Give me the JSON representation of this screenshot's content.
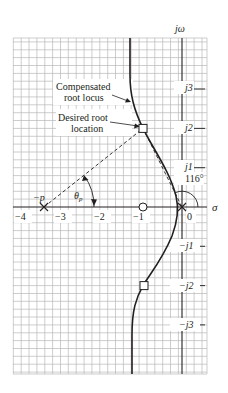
{
  "figure": {
    "type": "root_locus",
    "axes": {
      "imag_label": "jω",
      "real_label": "σ",
      "x_ticks": [
        {
          "value": -4,
          "label": "−4"
        },
        {
          "value": -3,
          "label": "−3"
        },
        {
          "value": -2,
          "label": "−2"
        },
        {
          "value": -1,
          "label": "−1"
        },
        {
          "value": 0,
          "label": "0"
        }
      ],
      "y_ticks": [
        {
          "value": 3,
          "label": "j3"
        },
        {
          "value": 2,
          "label": "j2"
        },
        {
          "value": 1,
          "label": "j1"
        },
        {
          "value": -1,
          "label": "−j1"
        },
        {
          "value": -2,
          "label": "−j2"
        },
        {
          "value": -3,
          "label": "−j3"
        }
      ],
      "grid_step": 0.2
    },
    "annotations": {
      "compensated_line1": "Compensated",
      "compensated_line2": "root locus",
      "desired_line1": "Desired root",
      "desired_line2": "location",
      "pole_label": "−p",
      "theta_label": "θ",
      "theta_sub": "p",
      "angle_label": "116°"
    },
    "poles": [
      {
        "sigma": -3.5,
        "omega": 0,
        "label": "−p"
      },
      {
        "sigma": 0,
        "omega": 0,
        "label": ""
      }
    ],
    "zeros": [
      {
        "sigma": -1,
        "omega": 0
      }
    ],
    "desired_roots": [
      {
        "sigma": -1,
        "omega": 2
      },
      {
        "sigma": -1,
        "omega": -2
      }
    ],
    "colors": {
      "grid": "#b5b5b5",
      "axis": "#231f20",
      "locus": "#231f20"
    }
  }
}
